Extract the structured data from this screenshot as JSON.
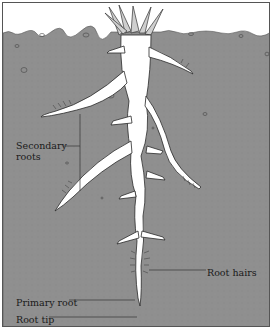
{
  "diagram": {
    "colors": {
      "soil": "#8f8f8f",
      "root": "#ffffff",
      "outline": "#2a2a2a",
      "sky": "#ffffff",
      "leader_line": "#333333"
    },
    "labels": {
      "secondary_roots_line1": "Secondary",
      "secondary_roots_line2": "roots",
      "root_hairs": "Root hairs",
      "primary_root": "Primary root",
      "root_tip": "Root tip"
    }
  }
}
